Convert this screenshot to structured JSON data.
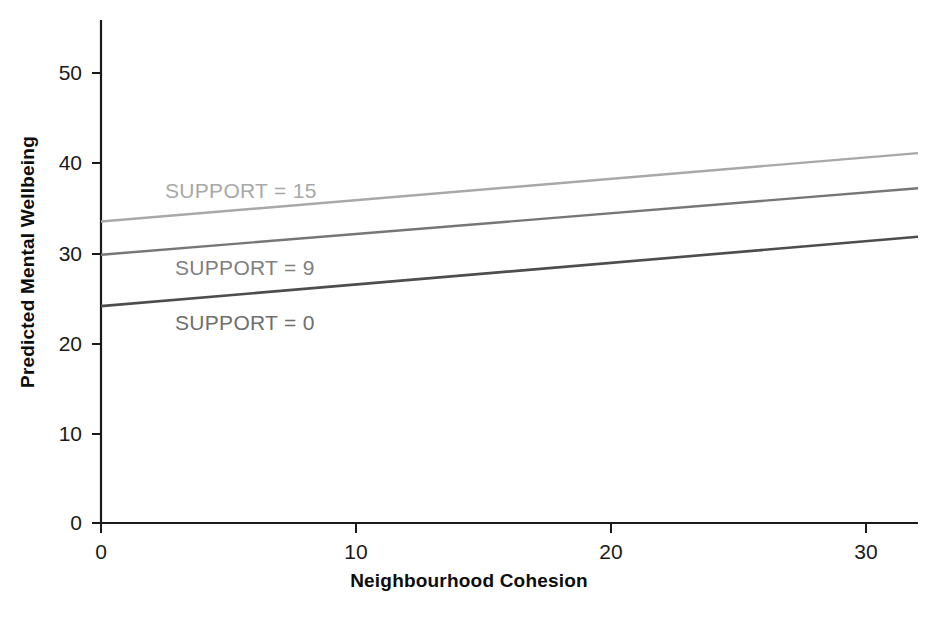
{
  "chart_data": {
    "type": "line",
    "title": "",
    "subtitle": "",
    "xlabel": "Neighbourhood Cohesion",
    "ylabel": "Predicted Mental Wellbeing",
    "xlim": [
      0,
      32
    ],
    "ylim": [
      0,
      56
    ],
    "xticks": [
      0,
      10,
      20,
      30
    ],
    "xtick_labels": [
      "0",
      "10",
      "20",
      "30"
    ],
    "yticks": [
      0,
      10,
      20,
      30,
      40,
      50
    ],
    "ytick_labels": [
      "0",
      "10",
      "20",
      "30",
      "40",
      "50"
    ],
    "grid": false,
    "legend_position": "inline-annotations",
    "x": [
      0,
      32
    ],
    "series": [
      {
        "name": "SUPPORT = 15",
        "values": [
          33.5,
          41.1
        ],
        "color": "#a8a8a8",
        "label_text": "SUPPORT = 15"
      },
      {
        "name": "SUPPORT = 9",
        "values": [
          29.8,
          37.2
        ],
        "color": "#767676",
        "label_text": "SUPPORT = 9"
      },
      {
        "name": "SUPPORT = 0",
        "values": [
          24.1,
          31.8
        ],
        "color": "#4d4d4d",
        "label_text": "SUPPORT = 0"
      }
    ],
    "annotations": [
      {
        "text": "SUPPORT = 15",
        "x": 2.5,
        "y": 37.0,
        "color": "#a8a8a8"
      },
      {
        "text": "SUPPORT = 9",
        "x": 3.0,
        "y": 28.5,
        "color": "#808080"
      },
      {
        "text": "SUPPORT = 0",
        "x": 3.0,
        "y": 22.5,
        "color": "#6e6e6e"
      }
    ]
  },
  "axes": {
    "x_title": "Neighbourhood Cohesion",
    "y_title": "Predicted Mental Wellbeing",
    "x_tick_labels": [
      "0",
      "10",
      "20",
      "30"
    ],
    "y_tick_labels": [
      "50",
      "40",
      "30",
      "20",
      "10",
      "0"
    ]
  },
  "colors": {
    "axis": "#1a1a1a",
    "background": "#ffffff",
    "line_support_15": "#a8a8a8",
    "line_support_9": "#767676",
    "line_support_0": "#4d4d4d"
  }
}
